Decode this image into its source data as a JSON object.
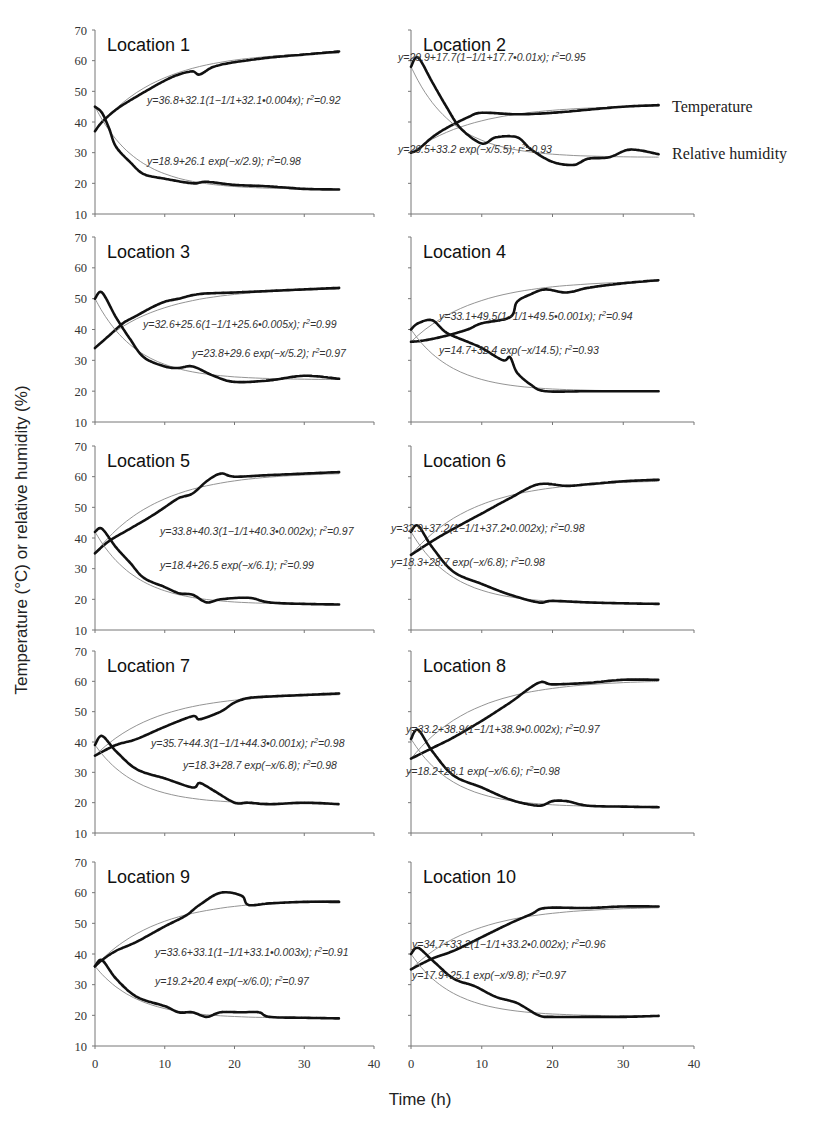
{
  "figure": {
    "ylabel": "Temperature (°C) or relative humidity (%)",
    "xlabel": "Time (h)",
    "legend": {
      "temperature": "Temperature",
      "humidity": "Relative humidity"
    }
  },
  "axes": {
    "x_ticks": [
      "0",
      "10",
      "20",
      "30",
      "40"
    ],
    "y_ticks": [
      "70",
      "60",
      "50",
      "40",
      "30",
      "20",
      "10"
    ]
  },
  "chart_data": [
    {
      "type": "line",
      "title": "Location 1",
      "xlim": [
        0,
        40
      ],
      "ylim": [
        10,
        70
      ],
      "xlabel": "Time (h)",
      "ylabel": "Temperature (°C) or relative humidity (%)",
      "series": [
        {
          "name": "Temperature",
          "x": [
            0,
            1,
            3,
            5,
            8,
            10,
            12,
            14,
            15,
            17,
            20,
            25,
            30,
            35
          ],
          "values": [
            37,
            40,
            44,
            47,
            51,
            53.5,
            55.5,
            56.5,
            55.5,
            58,
            59.5,
            61,
            62,
            63
          ]
        },
        {
          "name": "Relative humidity",
          "x": [
            0,
            1,
            2,
            3,
            5,
            7,
            10,
            14,
            16,
            20,
            25,
            30,
            35
          ],
          "values": [
            45,
            43,
            38,
            32,
            27,
            23,
            21.5,
            20,
            20.5,
            19.5,
            19,
            18.2,
            18
          ]
        }
      ],
      "fits": {
        "temperature": "y=36.8+32.1(1−1/1+32.1•0.004x); r²=0.92",
        "humidity": "y=18.9+26.1 exp(−x/2.9); r²=0.98"
      }
    },
    {
      "type": "line",
      "title": "Location 2",
      "xlim": [
        0,
        40
      ],
      "ylim": [
        10,
        70
      ],
      "series": [
        {
          "name": "Temperature",
          "x": [
            0,
            1,
            3,
            5,
            8,
            10,
            15,
            20,
            25,
            30,
            35
          ],
          "values": [
            30,
            31,
            35,
            38,
            41.5,
            43,
            42.5,
            43,
            44,
            45,
            45.5
          ]
        },
        {
          "name": "Relative humidity",
          "x": [
            0,
            1,
            3,
            5,
            7,
            10,
            12,
            15,
            17,
            20,
            23,
            25,
            28,
            31,
            35
          ],
          "values": [
            58,
            61,
            53,
            45,
            38,
            33,
            35,
            35,
            31,
            27,
            26,
            28,
            28.5,
            31,
            29.5
          ]
        }
      ],
      "fits": {
        "temperature": "y=29.9+17.7(1−1/1+17.7•0.01x); r²=0.95",
        "humidity": "y=29.5+33.2 exp(−x/5.5); r²=0.93"
      }
    },
    {
      "type": "line",
      "title": "Location 3",
      "xlim": [
        0,
        40
      ],
      "ylim": [
        10,
        70
      ],
      "series": [
        {
          "name": "Temperature",
          "x": [
            0,
            2,
            4,
            6,
            8,
            10,
            12,
            15,
            20,
            25,
            30,
            35
          ],
          "values": [
            34,
            38,
            42,
            44.5,
            47,
            49,
            50,
            51.5,
            52,
            52.5,
            53,
            53.5
          ]
        },
        {
          "name": "Relative humidity",
          "x": [
            0,
            1,
            3,
            5,
            7,
            10,
            12,
            14,
            17,
            20,
            25,
            30,
            35
          ],
          "values": [
            50,
            52,
            44,
            37,
            31,
            28,
            27.5,
            28,
            25,
            23,
            23.5,
            25,
            24
          ]
        }
      ],
      "fits": {
        "temperature": "y=32.6+25.6(1−1/1+25.6•0.005x); r²=0.99",
        "humidity": "y=23.8+29.6 exp(−x/5.2); r²=0.97"
      }
    },
    {
      "type": "line",
      "title": "Location 4",
      "xlim": [
        0,
        40
      ],
      "ylim": [
        10,
        70
      ],
      "series": [
        {
          "name": "Temperature",
          "x": [
            0,
            2,
            5,
            8,
            10,
            14,
            15,
            17,
            19,
            22,
            25,
            30,
            35
          ],
          "values": [
            36,
            36.5,
            38,
            40,
            42,
            44,
            49,
            51.5,
            53,
            52,
            53.5,
            55,
            56
          ]
        },
        {
          "name": "Relative humidity",
          "x": [
            0,
            1,
            3,
            5,
            8,
            10,
            13,
            14,
            15,
            17,
            19,
            25,
            30,
            35
          ],
          "values": [
            40,
            42,
            43,
            39,
            36,
            34,
            30,
            31,
            26,
            22,
            20,
            20,
            20,
            20
          ]
        }
      ],
      "fits": {
        "temperature": "y=33.1+49.5(1−1/1+49.5•0.001x); r²=0.94",
        "humidity": "y=14.7+32.4 exp(−x/14.5); r²=0.93"
      }
    },
    {
      "type": "line",
      "title": "Location 5",
      "xlim": [
        0,
        40
      ],
      "ylim": [
        10,
        70
      ],
      "series": [
        {
          "name": "Temperature",
          "x": [
            0,
            2,
            5,
            8,
            10,
            12,
            14,
            16,
            18,
            20,
            25,
            30,
            35
          ],
          "values": [
            35,
            39,
            43,
            47,
            50,
            53,
            54.5,
            58.5,
            61,
            60,
            60.5,
            61,
            61.5
          ]
        },
        {
          "name": "Relative humidity",
          "x": [
            0,
            1,
            3,
            5,
            7,
            10,
            12,
            14,
            16,
            18,
            22,
            25,
            30,
            35
          ],
          "values": [
            42,
            43,
            37,
            32,
            27,
            24,
            22,
            21.5,
            19,
            20,
            20.5,
            19,
            18.5,
            18.3
          ]
        }
      ],
      "fits": {
        "temperature": "y=33.8+40.3(1−1/1+40.3•0.002x); r²=0.97",
        "humidity": "y=18.4+26.5 exp(−x/6.1); r²=0.99"
      }
    },
    {
      "type": "line",
      "title": "Location 6",
      "xlim": [
        0,
        40
      ],
      "ylim": [
        10,
        70
      ],
      "series": [
        {
          "name": "Temperature",
          "x": [
            0,
            3,
            6,
            10,
            14,
            18,
            22,
            25,
            30,
            35
          ],
          "values": [
            34.5,
            39,
            43,
            48,
            53,
            57.5,
            57,
            57.5,
            58.5,
            59
          ]
        },
        {
          "name": "Relative humidity",
          "x": [
            0,
            1,
            3,
            6,
            10,
            14,
            18,
            20,
            25,
            30,
            35
          ],
          "values": [
            42,
            44,
            37,
            29,
            25,
            21.5,
            19,
            19.5,
            19,
            18.7,
            18.5
          ]
        }
      ],
      "fits": {
        "temperature": "y=32.9+37.2(1−1/1+37.2•0.002x); r²=0.98",
        "humidity": "y=18.3+28.7 exp(−x/6.8); r²=0.98"
      }
    },
    {
      "type": "line",
      "title": "Location 7",
      "xlim": [
        0,
        40
      ],
      "ylim": [
        10,
        70
      ],
      "series": [
        {
          "name": "Temperature",
          "x": [
            0,
            3,
            6,
            10,
            14,
            15,
            18,
            20,
            22,
            25,
            30,
            35
          ],
          "values": [
            35.5,
            39,
            41,
            45,
            48.5,
            47.5,
            50,
            53,
            54.5,
            55,
            55.5,
            56
          ]
        },
        {
          "name": "Relative humidity",
          "x": [
            0,
            1,
            3,
            6,
            10,
            14,
            15,
            17,
            20,
            22,
            25,
            30,
            35
          ],
          "values": [
            39,
            42,
            37,
            31,
            28,
            25,
            26.5,
            24,
            20,
            20,
            19.5,
            20,
            19.5
          ]
        }
      ],
      "fits": {
        "temperature": "y=35.7+44.3(1−1/1+44.3•0.001x); r²=0.98",
        "humidity": "y=18.3+28.7 exp(−x/6.8); r²=0.98"
      }
    },
    {
      "type": "line",
      "title": "Location 8",
      "xlim": [
        0,
        40
      ],
      "ylim": [
        10,
        70
      ],
      "series": [
        {
          "name": "Temperature",
          "x": [
            0,
            3,
            6,
            10,
            14,
            18,
            20,
            25,
            30,
            35
          ],
          "values": [
            34.5,
            38,
            41.5,
            47,
            53,
            59.5,
            59,
            59.5,
            60.5,
            60.5
          ]
        },
        {
          "name": "Relative humidity",
          "x": [
            0,
            1,
            3,
            6,
            10,
            14,
            18,
            20,
            22,
            25,
            30,
            35
          ],
          "values": [
            41,
            44,
            37,
            29,
            25,
            21,
            19,
            20.5,
            20.5,
            19,
            18.7,
            18.5
          ]
        }
      ],
      "fits": {
        "temperature": "y=33.2+38.9(1−1/1+38.9•0.002x); r²=0.97",
        "humidity": "y=18.2+28.1 exp(−x/6.6); r²=0.98"
      }
    },
    {
      "type": "line",
      "title": "Location 9",
      "xlim": [
        0,
        40
      ],
      "ylim": [
        10,
        70
      ],
      "series": [
        {
          "name": "Temperature",
          "x": [
            0,
            1,
            3,
            6,
            10,
            13,
            15,
            18,
            21,
            22,
            25,
            30,
            35
          ],
          "values": [
            36,
            38,
            41,
            44,
            49,
            52.5,
            56,
            60,
            59,
            56,
            56.5,
            57,
            57
          ]
        },
        {
          "name": "Relative humidity",
          "x": [
            0,
            1,
            3,
            6,
            10,
            12,
            14,
            16,
            18,
            21,
            23.5,
            25,
            30,
            35
          ],
          "values": [
            36,
            38,
            32,
            26,
            23,
            21,
            21,
            19.5,
            21,
            21,
            21,
            19.5,
            19.2,
            19
          ]
        }
      ],
      "fits": {
        "temperature": "y=33.6+33.1(1−1/1+33.1•0.003x); r²=0.91",
        "humidity": "y=19.2+20.4 exp(−x/6.0); r²=0.97"
      }
    },
    {
      "type": "line",
      "title": "Location 10",
      "xlim": [
        0,
        40
      ],
      "ylim": [
        10,
        70
      ],
      "series": [
        {
          "name": "Temperature",
          "x": [
            0,
            3,
            6,
            10,
            14,
            17,
            19,
            25,
            30,
            35
          ],
          "values": [
            35,
            38.5,
            41,
            45.5,
            50,
            53,
            55,
            55,
            55.5,
            55.5
          ]
        },
        {
          "name": "Relative humidity",
          "x": [
            0,
            1,
            3,
            6,
            9,
            12,
            15,
            18,
            20,
            25,
            30,
            35
          ],
          "values": [
            40,
            42,
            38,
            32,
            29.5,
            26,
            24,
            20,
            19.5,
            19.5,
            19.5,
            19.8
          ]
        }
      ],
      "fits": {
        "temperature": "y=34.7+33.2(1−1/1+33.2•0.002x); r²=0.96",
        "humidity": "y=17.9+25.1 exp(−x/9.8); r²=0.97"
      }
    }
  ]
}
